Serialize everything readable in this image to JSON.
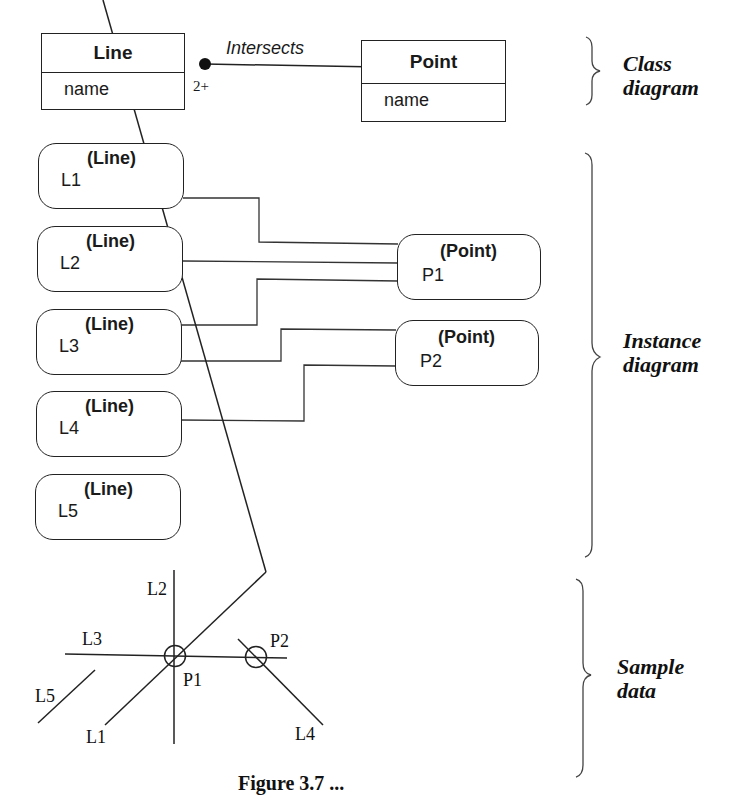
{
  "class_diagram": {
    "classes": [
      {
        "name": "Line",
        "attribute": "name"
      },
      {
        "name": "Point",
        "attribute": "name"
      }
    ],
    "association": {
      "name": "Intersects",
      "multiplicity_line_end": "2+"
    },
    "section_label": [
      "Class",
      "diagram"
    ]
  },
  "instance_diagram": {
    "lines": [
      {
        "class": "(Line)",
        "name": "L1"
      },
      {
        "class": "(Line)",
        "name": "L2"
      },
      {
        "class": "(Line)",
        "name": "L3"
      },
      {
        "class": "(Line)",
        "name": "L4"
      },
      {
        "class": "(Line)",
        "name": "L5"
      }
    ],
    "points": [
      {
        "class": "(Point)",
        "name": "P1"
      },
      {
        "class": "(Point)",
        "name": "P2"
      }
    ],
    "links": [
      {
        "from": "L1",
        "to": "P1"
      },
      {
        "from": "L2",
        "to": "P1"
      },
      {
        "from": "L3",
        "to": "P1"
      },
      {
        "from": "L3",
        "to": "P2"
      },
      {
        "from": "L4",
        "to": "P2"
      }
    ],
    "section_label": [
      "Instance",
      "diagram"
    ]
  },
  "sample_data": {
    "labels": {
      "L1": "L1",
      "L2": "L2",
      "L3": "L3",
      "L4": "L4",
      "L5": "L5",
      "P1": "P1",
      "P2": "P2"
    },
    "section_label": [
      "Sample",
      "data"
    ]
  },
  "caption": "Figure 3.7 ..."
}
